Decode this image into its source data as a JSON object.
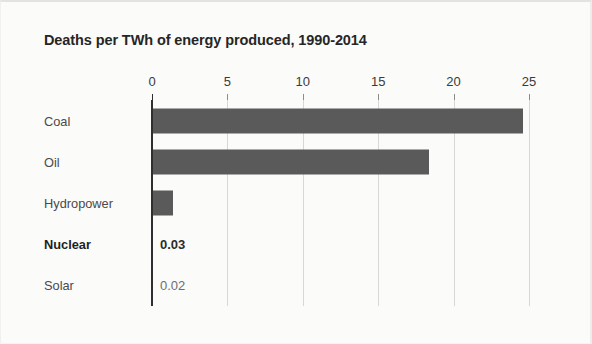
{
  "chart_data": {
    "type": "bar",
    "orientation": "horizontal",
    "title": "Deaths per TWh of energy produced, 1990-2014",
    "xlabel": "",
    "ylabel": "",
    "xlim": [
      0,
      25
    ],
    "xticks": [
      0,
      5,
      10,
      15,
      20,
      25
    ],
    "xtick_labels": [
      "0",
      "5",
      "10",
      "15",
      "20",
      "25"
    ],
    "grid": true,
    "legend": "none",
    "categories": [
      "Coal",
      "Oil",
      "Hydropower",
      "Nuclear",
      "Solar"
    ],
    "values": [
      24.6,
      18.4,
      1.4,
      0.03,
      0.02
    ],
    "bars": [
      {
        "category": "Coal",
        "value": 24.6,
        "bold": false,
        "value_label": "",
        "show_bar": true
      },
      {
        "category": "Oil",
        "value": 18.4,
        "bold": false,
        "value_label": "",
        "show_bar": true
      },
      {
        "category": "Hydropower",
        "value": 1.4,
        "bold": false,
        "value_label": "",
        "show_bar": true
      },
      {
        "category": "Nuclear",
        "value": 0.03,
        "bold": true,
        "value_label": "0.03",
        "show_bar": false
      },
      {
        "category": "Solar",
        "value": 0.02,
        "bold": false,
        "value_label": "0.02",
        "show_bar": false
      }
    ],
    "colors": {
      "bar": "#5a5a5a",
      "gridline": "#d7d7d4",
      "axis": "#2f2f2f",
      "background": "#fbfbfa",
      "title_text": "#262626",
      "label_text": "#4a4a4a"
    }
  }
}
